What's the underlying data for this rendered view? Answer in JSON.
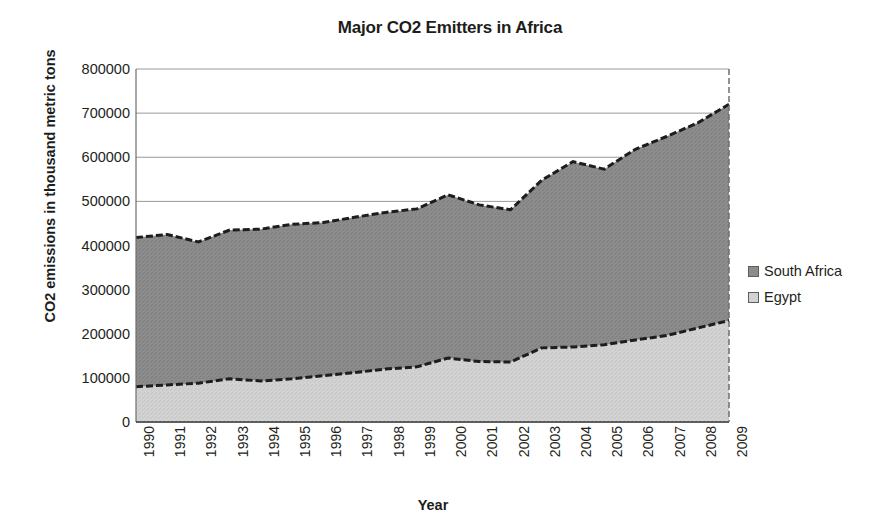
{
  "chart_data": {
    "type": "area",
    "stacked": true,
    "title": "Major CO2 Emitters in Africa",
    "xlabel": "Year",
    "ylabel": "CO2 emissions in thousand metric tons",
    "categories": [
      "1990",
      "1991",
      "1992",
      "1993",
      "1994",
      "1995",
      "1996",
      "1997",
      "1998",
      "1999",
      "2000",
      "2001",
      "2002",
      "2003",
      "2004",
      "2005",
      "2006",
      "2007",
      "2008",
      "2009"
    ],
    "series": [
      {
        "name": "Egypt",
        "color": "#d2d2d2",
        "values": [
          80000,
          84000,
          88000,
          98000,
          93000,
          98000,
          105000,
          112000,
          120000,
          125000,
          145000,
          137000,
          136000,
          168000,
          170000,
          175000,
          186000,
          196000,
          213000,
          230000
        ]
      },
      {
        "name": "South Africa",
        "color": "#8c8c8c",
        "values": [
          338000,
          341000,
          320000,
          337000,
          344000,
          350000,
          347000,
          352000,
          355000,
          358000,
          370000,
          355000,
          345000,
          380000,
          420000,
          398000,
          432000,
          451000,
          465000,
          490000
        ]
      }
    ],
    "totals": [
      418000,
      425000,
      408000,
      435000,
      437000,
      448000,
      452000,
      464000,
      475000,
      483000,
      515000,
      492000,
      481000,
      548000,
      590000,
      573000,
      618000,
      647000,
      678000,
      720000
    ],
    "ylim": [
      0,
      800000
    ],
    "ytick_values": [
      800000,
      700000,
      600000,
      500000,
      400000,
      300000,
      200000,
      100000,
      0
    ],
    "ytick_labels": [
      "800000",
      "700000",
      "600000",
      "500000",
      "400000",
      "300000",
      "200000",
      "100000",
      "0"
    ],
    "grid": true,
    "legend_position": "right",
    "border_style": "dashed-dark"
  },
  "legend": {
    "items": [
      {
        "label": "South Africa",
        "color": "#8c8c8c"
      },
      {
        "label": "Egypt",
        "color": "#d2d2d2"
      }
    ]
  }
}
